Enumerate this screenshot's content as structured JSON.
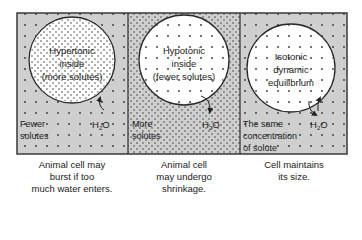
{
  "colors": {
    "background": "#ffffff",
    "panel_fill": "#cfcfcf",
    "cell_fill": "#ffffff",
    "border": "#3a3a3a",
    "dot": "#333333",
    "text": "#222222"
  },
  "panels": [
    {
      "cell_label": [
        "Hypertonic",
        "inside",
        "(more solutes)"
      ],
      "outside_label": [
        "Fewer",
        "solutes"
      ],
      "water_label": "H2O",
      "arrow": "inward",
      "outside_density": "sparse",
      "inside_density": "dense",
      "caption": [
        "Animal cell may",
        "burst if too",
        "much water enters."
      ]
    },
    {
      "cell_label": [
        "Hypotonic",
        "inside",
        "(fewer solutes)"
      ],
      "outside_label": [
        "More",
        "solutes"
      ],
      "water_label": "H2O",
      "arrow": "outward",
      "outside_density": "dense",
      "inside_density": "sparse",
      "caption": [
        "Animal cell",
        "may undergo",
        "shrinkage."
      ]
    },
    {
      "cell_label": [
        "Isotonic",
        "dynamic",
        "equilibrium"
      ],
      "outside_label": [
        "The same",
        "concentration",
        "of solute"
      ],
      "water_label": "H2O",
      "arrow": "both",
      "outside_density": "sparse",
      "inside_density": "sparse",
      "caption": [
        "Cell maintains",
        "its size."
      ]
    }
  ]
}
